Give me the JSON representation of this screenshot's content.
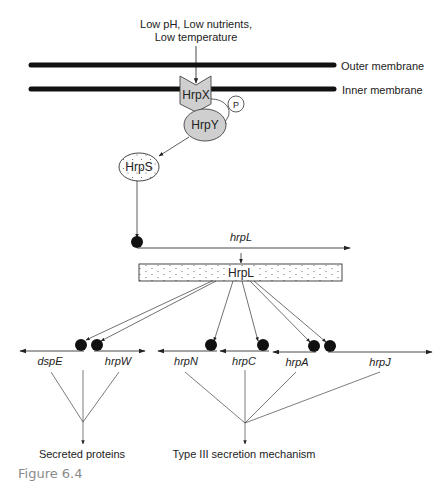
{
  "figure": {
    "caption": "Figure 6.4",
    "stimulus": {
      "line1": "Low pH, Low nutrients,",
      "line2": "Low temperature"
    },
    "membranes": {
      "outer": "Outer membrane",
      "inner": "Inner membrane"
    },
    "proteins": {
      "sensor": "HrpX",
      "phosphate": "P",
      "regulator": "HrpY",
      "sigma_activator": "HrpS",
      "sigma_factor": "HrpL"
    },
    "genes": {
      "hrpL": "hrpL",
      "dspE": "dspE",
      "hrpW": "hrpW",
      "hrpN": "hrpN",
      "hrpC": "hrpC",
      "hrpA": "hrpA",
      "hrpJ": "hrpJ"
    },
    "outputs": {
      "secreted": "Secreted proteins",
      "t3ss": "Type III secretion mechanism"
    },
    "colors": {
      "membrane": "#111111",
      "protein_fill": "#cfcfcf",
      "line": "#333333",
      "caption": "#8a8a8a"
    }
  }
}
